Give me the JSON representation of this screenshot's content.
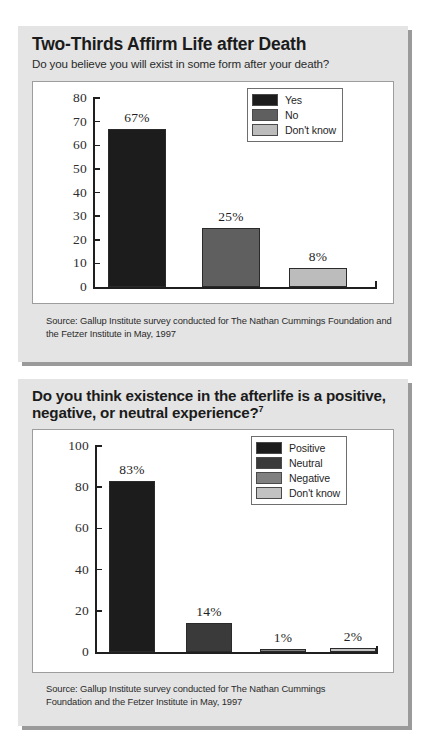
{
  "colors": {
    "page_background": "#ffffff",
    "panel_background": "#e4e4e4",
    "panel_shadow": "#9a9a9a",
    "plot_background": "#ffffff",
    "axis": "#1f1f1f",
    "series_black": "#1c1c1c",
    "series_dark_gray": "#3a3a3a",
    "series_mid_gray": "#5f5f5f",
    "series_light_gray": "#bcbcbc"
  },
  "charts": [
    {
      "id": "life-after-death",
      "title": "Two-Thirds Affirm Life after Death",
      "subtitle": "Do you believe you will exist in some form after your death?",
      "footnote_marker": "",
      "source": "Source: Gallup Institute survey conducted for The Nathan Cummings Foundation and the Fetzer Institute in May, 1997",
      "legend": [
        {
          "label": "Yes",
          "color": "#1c1c1c"
        },
        {
          "label": "No",
          "color": "#5f5f5f"
        },
        {
          "label": "Don't know",
          "color": "#bcbcbc"
        }
      ],
      "y_ticks": [
        "80",
        "70",
        "60",
        "50",
        "40",
        "30",
        "20",
        "10",
        "0"
      ],
      "bars": [
        {
          "label": "Yes",
          "value": 67,
          "value_label": "67%",
          "color": "#1c1c1c"
        },
        {
          "label": "No",
          "value": 25,
          "value_label": "25%",
          "color": "#5f5f5f"
        },
        {
          "label": "Don't know",
          "value": 8,
          "value_label": "8%",
          "color": "#bcbcbc"
        }
      ]
    },
    {
      "id": "afterlife-experience",
      "title": "Do you think existence in the afterlife is a positive, negative, or neutral experience?",
      "subtitle": "",
      "footnote_marker": "7",
      "source": "Source: Gallup Institute survey conducted for The Nathan Cummings Foundation and the Fetzer Institute in May, 1997",
      "legend": [
        {
          "label": "Positive",
          "color": "#1c1c1c"
        },
        {
          "label": "Neutral",
          "color": "#3a3a3a"
        },
        {
          "label": "Negative",
          "color": "#808080"
        },
        {
          "label": "Don't know",
          "color": "#c2c2c2"
        }
      ],
      "y_ticks": [
        "100",
        "80",
        "60",
        "40",
        "20",
        "0"
      ],
      "bars": [
        {
          "label": "Positive",
          "value": 83,
          "value_label": "83%",
          "color": "#1c1c1c"
        },
        {
          "label": "Neutral",
          "value": 14,
          "value_label": "14%",
          "color": "#3a3a3a"
        },
        {
          "label": "Negative",
          "value": 1,
          "value_label": "1%",
          "color": "#808080"
        },
        {
          "label": "Don't know",
          "value": 2,
          "value_label": "2%",
          "color": "#c2c2c2"
        }
      ]
    }
  ],
  "chart_data": [
    {
      "type": "bar",
      "title": "Two-Thirds Affirm Life after Death",
      "subtitle": "Do you believe you will exist in some form after your death?",
      "categories": [
        "Yes",
        "No",
        "Don't know"
      ],
      "values": [
        67,
        25,
        8
      ],
      "data_labels": [
        "67%",
        "25%",
        "8%"
      ],
      "xlabel": "",
      "ylabel": "",
      "ylim": [
        0,
        80
      ],
      "ytick_step": 10,
      "yticks": [
        0,
        10,
        20,
        30,
        40,
        50,
        60,
        70,
        80
      ],
      "grid": false,
      "legend": [
        "Yes",
        "No",
        "Don't know"
      ],
      "legend_position": "top-right",
      "series_colors": [
        "#1c1c1c",
        "#5f5f5f",
        "#bcbcbc"
      ],
      "annotations": [
        "Source: Gallup Institute survey conducted for The Nathan Cummings Foundation and the Fetzer Institute in May, 1997"
      ]
    },
    {
      "type": "bar",
      "title": "Do you think existence in the afterlife is a positive, negative, or neutral experience?",
      "subtitle": "",
      "categories": [
        "Positive",
        "Neutral",
        "Negative",
        "Don't know"
      ],
      "values": [
        83,
        14,
        1,
        2
      ],
      "data_labels": [
        "83%",
        "14%",
        "1%",
        "2%"
      ],
      "xlabel": "",
      "ylabel": "",
      "ylim": [
        0,
        100
      ],
      "ytick_step": 20,
      "yticks": [
        0,
        20,
        40,
        60,
        80,
        100
      ],
      "grid": false,
      "legend": [
        "Positive",
        "Neutral",
        "Negative",
        "Don't know"
      ],
      "legend_position": "top-right",
      "series_colors": [
        "#1c1c1c",
        "#3a3a3a",
        "#808080",
        "#c2c2c2"
      ],
      "annotations": [
        "Source: Gallup Institute survey conducted for The Nathan Cummings Foundation and the Fetzer Institute in May, 1997"
      ]
    }
  ]
}
